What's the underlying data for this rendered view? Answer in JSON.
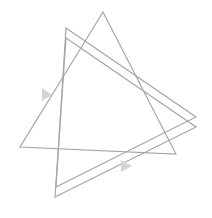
{
  "diagram": {
    "width": 212,
    "height": 218,
    "stroke_color": "#a6a6a6",
    "arrow_color": "#d4d4d4",
    "background": "#ffffff",
    "shapes": [
      {
        "name": "upright-triangle",
        "points": "103,12 20,147 176,154"
      },
      {
        "name": "rotated-triangle-outer",
        "points": "66,28 196,117 56,187"
      },
      {
        "name": "rotated-triangle-inner",
        "points": "66,38 196,127 55,197"
      }
    ],
    "arrows": [
      {
        "name": "left-arrow",
        "points": "42,88 42,101 52,95"
      },
      {
        "name": "bottom-arrow",
        "points": "121,160 121,172 132,166"
      }
    ]
  }
}
